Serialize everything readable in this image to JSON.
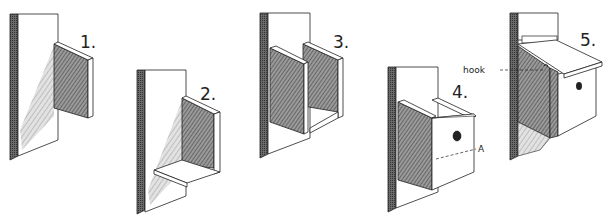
{
  "figure": {
    "steps": [
      {
        "label": "1."
      },
      {
        "label": "2."
      },
      {
        "label": "3."
      },
      {
        "label": "4."
      },
      {
        "label": "5."
      }
    ],
    "annotations": {
      "hook": "hook",
      "point_a": "A"
    }
  },
  "colors": {
    "ink": "#222222",
    "hatch": "#555555",
    "paper": "#ffffff"
  }
}
